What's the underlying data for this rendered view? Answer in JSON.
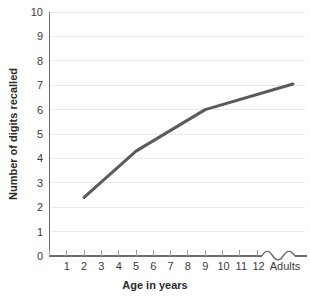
{
  "chart_data": {
    "type": "line",
    "title": "",
    "xlabel": "Age in years",
    "ylabel": "Number of digits recalled",
    "categories": [
      "1",
      "2",
      "3",
      "4",
      "5",
      "6",
      "7",
      "8",
      "9",
      "10",
      "11",
      "12",
      "Adults"
    ],
    "x_tick_labels": [
      "1",
      "2",
      "3",
      "4",
      "5",
      "6",
      "7",
      "8",
      "9",
      "10",
      "11",
      "12",
      "Adults"
    ],
    "y_tick_labels": [
      "0",
      "1",
      "2",
      "3",
      "4",
      "5",
      "6",
      "7",
      "8",
      "9",
      "10"
    ],
    "ylim": [
      0,
      10
    ],
    "grid": true,
    "legend": false,
    "legend_position": "none",
    "axis_break": true,
    "axis_break_note": "wavy break in x-axis between 12 and Adults",
    "series": [
      {
        "name": "Digit span",
        "color": "#5a5a5a",
        "points": [
          {
            "x": "2",
            "y": 2.4
          },
          {
            "x": "5",
            "y": 4.3
          },
          {
            "x": "9",
            "y": 6.0
          },
          {
            "x": "Adults",
            "y": 7.05
          }
        ]
      }
    ]
  },
  "colors": {
    "line": "#5a5a5a",
    "grid": "#e9e9e9",
    "axis": "#6d6d6d",
    "text": "#2b2b2b",
    "background": "#ffffff"
  }
}
